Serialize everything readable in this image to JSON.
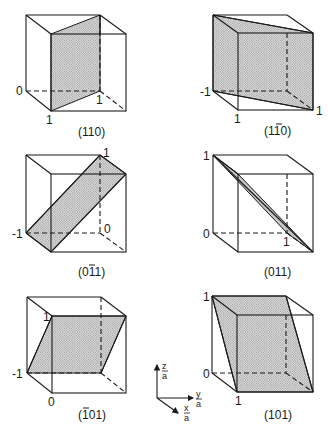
{
  "figure": {
    "panels": [
      {
        "caption": "(110)",
        "caption_parts": {
          "pre": "(",
          "h": "1",
          "k": "1",
          "l": "0",
          "post": ")",
          "bars": []
        },
        "intercept_labels": [
          "0",
          "1",
          "1"
        ]
      },
      {
        "caption": "(1̅1̅0)",
        "caption_parts": {
          "pre": "(",
          "h": "1",
          "k": "1",
          "l": "0",
          "post": ")",
          "bars": [
            "k"
          ]
        },
        "intercept_labels": [
          "-1",
          "1",
          "1"
        ]
      },
      {
        "caption": "(0̅1̅1)",
        "caption_parts": {
          "pre": "(",
          "h": "0",
          "k": "1",
          "l": "1",
          "post": ")",
          "bars": [
            "k"
          ]
        },
        "intercept_labels": [
          "1",
          "-1",
          "0"
        ]
      },
      {
        "caption": "(011)",
        "caption_parts": {
          "pre": "(",
          "h": "0",
          "k": "1",
          "l": "1",
          "post": ")",
          "bars": []
        },
        "intercept_labels": [
          "1",
          "0",
          "1"
        ]
      },
      {
        "caption": "(̅1̅101)",
        "caption_parts": {
          "pre": "(",
          "h": "1",
          "k": "0",
          "l": "1",
          "post": ")",
          "bars": [
            "h"
          ]
        },
        "intercept_labels": [
          "1",
          "-1",
          "0"
        ]
      },
      {
        "caption": "(101)",
        "caption_parts": {
          "pre": "(",
          "h": "1",
          "k": "0",
          "l": "1",
          "post": ")",
          "bars": []
        },
        "intercept_labels": [
          "1",
          "0",
          "1"
        ]
      }
    ],
    "axes_legend": {
      "z": "z",
      "y": "y",
      "x": "x",
      "denominator": "a"
    }
  }
}
